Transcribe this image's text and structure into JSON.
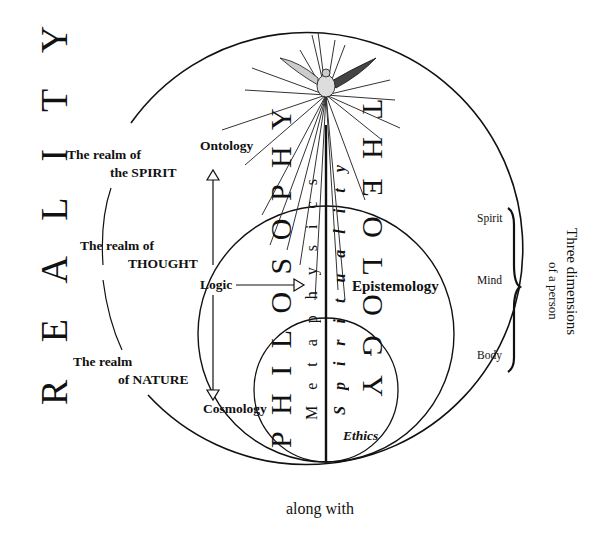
{
  "title_vertical": "R E A L I T Y",
  "realms": [
    {
      "line1": "The realm of",
      "line2": "the SPIRIT"
    },
    {
      "line1": "The realm of",
      "line2": "THOUGHT"
    },
    {
      "line1": "The realm",
      "line2": "of NATURE"
    }
  ],
  "branches": {
    "top": "Ontology",
    "middle": "Logic",
    "bottom": "Cosmology",
    "right": "Epistemology",
    "inner": "Ethics"
  },
  "disciplines": {
    "philosophy": "P H I L O S O P H Y",
    "theology": "T H E O L O G Y",
    "metaphysics": "M e t a p h y s i c s",
    "spirituality": "S p i r i t u a l i t y"
  },
  "person": {
    "title_line1": "Three dimensions",
    "title_line2": "of a person",
    "levels": [
      "Spirit",
      "Mind",
      "Body"
    ]
  },
  "footer": "along with",
  "colors": {
    "ink": "#111111",
    "background": "#ffffff"
  }
}
